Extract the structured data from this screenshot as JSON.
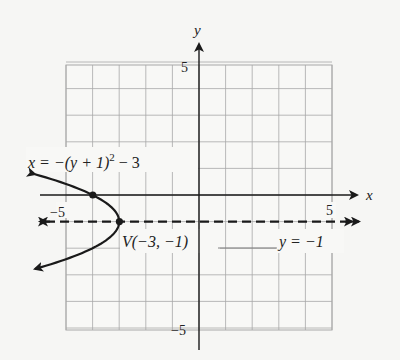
{
  "chart_data": {
    "type": "line",
    "title": "",
    "xlabel": "x",
    "ylabel": "y",
    "xlim": [
      -5,
      5
    ],
    "ylim": [
      -5,
      5
    ],
    "grid": true,
    "tick_labels": {
      "x_min": "−5",
      "x_max": "5",
      "y_max": "5",
      "y_min": "−5"
    },
    "series": [
      {
        "name": "parabola",
        "equation": "x = −(y + 1)^2 − 3",
        "style": "solid",
        "arrows": "both",
        "points": [
          {
            "x": -6.25,
            "y": 0.8
          },
          {
            "x": -4,
            "y": 0
          },
          {
            "x": -3,
            "y": -1
          },
          {
            "x": -4,
            "y": -2
          },
          {
            "x": -6.25,
            "y": -2.8
          }
        ]
      },
      {
        "name": "axis of symmetry",
        "equation": "y = −1",
        "style": "dashed",
        "arrows": "both",
        "points": [
          {
            "x": -6.0,
            "y": -1
          },
          {
            "x": 6.0,
            "y": -1
          }
        ]
      }
    ],
    "marked_points": [
      {
        "x": -3,
        "y": -1,
        "label": "V(−3, −1)"
      },
      {
        "x": -4,
        "y": 0,
        "label": ""
      }
    ],
    "annotations": [
      {
        "text_main": "x = −(y + 1)",
        "text_sup": "2",
        "text_tail": " − 3"
      },
      {
        "text": "V(−3, −1)"
      },
      {
        "text": "y = −1"
      }
    ]
  },
  "labels": {
    "x_axis": "x",
    "y_axis": "y",
    "tick_x_min": "−5",
    "tick_x_max": "5",
    "tick_y_max": "5",
    "tick_y_min": "−5",
    "equation_main": "x = −(y + 1)",
    "equation_sup": "2",
    "equation_tail": " − 3",
    "vertex": "V(−3, −1)",
    "axis_of_symmetry": "y = −1"
  },
  "colors": {
    "background": "#f6f6f4",
    "grid": "#a8a8a8",
    "ink": "#1a1a1a"
  }
}
